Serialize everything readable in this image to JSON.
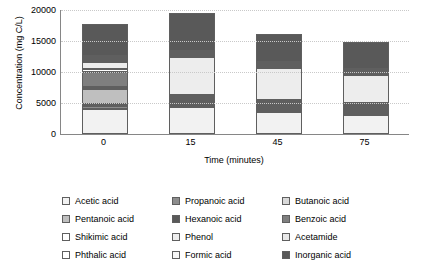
{
  "chart_data": {
    "type": "bar",
    "subtype": "stacked",
    "title": "",
    "xlabel": "Time (minutes)",
    "ylabel": "Concentration (mg C/L)",
    "categories": [
      "0",
      "15",
      "45",
      "75"
    ],
    "x": [
      0,
      15,
      45,
      75
    ],
    "ylim": [
      0,
      20000
    ],
    "yticks": [
      0,
      5000,
      10000,
      15000,
      20000
    ],
    "ytick_labels": [
      "0",
      "5000",
      "10000",
      "15000",
      "20000"
    ],
    "grid": true,
    "grid_axis": "y",
    "legend_position": "bottom",
    "legend_columns": 3,
    "series": [
      {
        "name": "Acetic acid",
        "color": "#f2f2f2",
        "values": [
          4100,
          4300,
          3500,
          3100
        ]
      },
      {
        "name": "Propanoic acid",
        "color": "#8d8d8d",
        "values": [
          400,
          300,
          250,
          250
        ]
      },
      {
        "name": "Butanoic acid",
        "color": "#d9d9d9",
        "values": [
          300,
          250,
          200,
          200
        ]
      },
      {
        "name": "Pentanoic acid",
        "color": "#bfbfbf",
        "values": [
          2500,
          300,
          250,
          250
        ]
      },
      {
        "name": "Hexanoic acid",
        "color": "#595959",
        "values": [
          300,
          250,
          200,
          200
        ]
      },
      {
        "name": "Benzoic acid",
        "color": "#7f7f7f",
        "values": [
          2300,
          350,
          250,
          250
        ]
      },
      {
        "name": "Shikimic acid",
        "color": "#ffffff",
        "values": [
          500,
          400,
          300,
          250
        ]
      },
      {
        "name": "Phenol",
        "color": "#ededed",
        "values": [
          1100,
          6100,
          5200,
          4450
        ]
      },
      {
        "name": "Acetamide",
        "color": "#e8e8e8",
        "values": [
          400,
          300,
          250,
          200
        ]
      },
      {
        "name": "Phthalic acid",
        "color": "#ffffff",
        "values": [
          300,
          300,
          250,
          200
        ]
      },
      {
        "name": "Formic acid",
        "color": "#f7f7f7",
        "values": [
          400,
          300,
          250,
          200
        ]
      },
      {
        "name": "Inorganic acid",
        "color": "#595959",
        "values": [
          5100,
          6150,
          4500,
          4450
        ]
      }
    ]
  }
}
